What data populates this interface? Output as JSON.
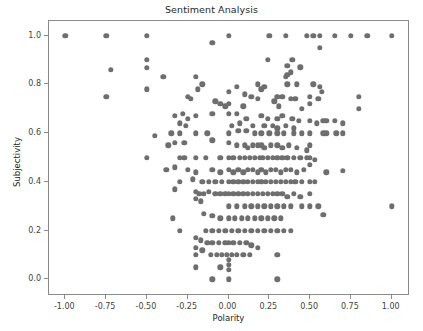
{
  "chart_data": {
    "type": "scatter",
    "title": "Sentiment Analysis",
    "xlabel": "Polarity",
    "ylabel": "Subjectivity",
    "xlim": [
      -1.1,
      1.1
    ],
    "ylim": [
      -0.06,
      1.06
    ],
    "xticks": [
      -1.0,
      -0.75,
      -0.5,
      -0.25,
      0.0,
      0.25,
      0.5,
      0.75,
      1.0
    ],
    "xticklabels": [
      "-1.00",
      "-0.75",
      "-0.50",
      "-0.25",
      "0.00",
      "0.25",
      "0.50",
      "0.75",
      "1.00"
    ],
    "yticks": [
      0.0,
      0.2,
      0.4,
      0.6,
      0.8,
      1.0
    ],
    "yticklabels": [
      "0.0",
      "0.2",
      "0.4",
      "0.6",
      "0.8",
      "1.0"
    ],
    "grid": false,
    "legend": null,
    "marker_color": "#6e6e6e",
    "marker_size": 5.4,
    "series": [
      {
        "name": "tweets",
        "points": [
          [
            -1.0,
            1.0
          ],
          [
            -0.75,
            1.0
          ],
          [
            -0.5,
            1.0
          ],
          [
            -0.1,
            0.97
          ],
          [
            0.0,
            1.0
          ],
          [
            0.25,
            1.0
          ],
          [
            0.35,
            1.0
          ],
          [
            0.48,
            1.0
          ],
          [
            0.52,
            1.0
          ],
          [
            0.56,
            1.0
          ],
          [
            0.65,
            1.0
          ],
          [
            0.75,
            1.0
          ],
          [
            0.85,
            1.0
          ],
          [
            1.0,
            1.0
          ],
          [
            0.56,
            0.95
          ],
          [
            -0.5,
            0.9
          ],
          [
            0.24,
            0.9
          ],
          [
            0.39,
            0.9
          ],
          [
            0.36,
            0.875
          ],
          [
            -0.72,
            0.86
          ],
          [
            -0.5,
            0.867
          ],
          [
            0.38,
            0.85
          ],
          [
            0.36,
            0.84
          ],
          [
            0.44,
            0.87
          ],
          [
            -0.4,
            0.83
          ],
          [
            -0.2,
            0.83
          ],
          [
            0.35,
            0.83
          ],
          [
            0.42,
            0.8
          ],
          [
            0.18,
            0.8
          ],
          [
            -0.16,
            0.8
          ],
          [
            -0.19,
            0.78
          ],
          [
            -0.5,
            0.78
          ],
          [
            0.52,
            0.8
          ],
          [
            0.56,
            0.79
          ],
          [
            0.57,
            0.77
          ],
          [
            0.36,
            0.8
          ],
          [
            0.05,
            0.79
          ],
          [
            0.22,
            0.79
          ],
          [
            0.2,
            0.78
          ],
          [
            -0.75,
            0.75
          ],
          [
            -0.25,
            0.75
          ],
          [
            -0.23,
            0.74
          ],
          [
            0.0,
            0.77
          ],
          [
            0.1,
            0.76
          ],
          [
            0.14,
            0.75
          ],
          [
            0.18,
            0.74
          ],
          [
            0.3,
            0.75
          ],
          [
            0.33,
            0.75
          ],
          [
            0.38,
            0.74
          ],
          [
            0.41,
            0.74
          ],
          [
            0.5,
            0.75
          ],
          [
            0.55,
            0.74
          ],
          [
            0.8,
            0.75
          ],
          [
            0.8,
            0.7
          ],
          [
            -0.08,
            0.73
          ],
          [
            -0.05,
            0.72
          ],
          [
            0.0,
            0.72
          ],
          [
            -0.02,
            0.71
          ],
          [
            0.45,
            0.7
          ],
          [
            0.5,
            0.72
          ],
          [
            0.09,
            0.71
          ],
          [
            0.28,
            0.73
          ],
          [
            0.31,
            0.71
          ],
          [
            -0.33,
            0.67
          ],
          [
            -0.28,
            0.68
          ],
          [
            -0.25,
            0.66
          ],
          [
            -0.2,
            0.67
          ],
          [
            -0.1,
            0.68
          ],
          [
            0.0,
            0.68
          ],
          [
            0.05,
            0.68
          ],
          [
            0.11,
            0.66
          ],
          [
            0.2,
            0.67
          ],
          [
            0.24,
            0.66
          ],
          [
            0.3,
            0.66
          ],
          [
            0.33,
            0.67
          ],
          [
            0.39,
            0.66
          ],
          [
            0.43,
            0.65
          ],
          [
            0.5,
            0.65
          ],
          [
            0.54,
            0.64
          ],
          [
            0.58,
            0.65
          ],
          [
            0.6,
            0.65
          ],
          [
            0.65,
            0.65
          ],
          [
            0.7,
            0.64
          ],
          [
            -0.3,
            0.64
          ],
          [
            -0.26,
            0.63
          ],
          [
            0.02,
            0.63
          ],
          [
            0.07,
            0.64
          ],
          [
            0.15,
            0.63
          ],
          [
            0.22,
            0.63
          ],
          [
            0.27,
            0.63
          ],
          [
            0.3,
            0.62
          ],
          [
            0.35,
            0.63
          ],
          [
            0.4,
            0.62
          ],
          [
            -0.45,
            0.59
          ],
          [
            -0.35,
            0.6
          ],
          [
            -0.3,
            0.6
          ],
          [
            -0.2,
            0.6
          ],
          [
            -0.13,
            0.6
          ],
          [
            0.0,
            0.6
          ],
          [
            0.06,
            0.61
          ],
          [
            0.11,
            0.61
          ],
          [
            0.16,
            0.6
          ],
          [
            0.2,
            0.6
          ],
          [
            0.25,
            0.6
          ],
          [
            0.3,
            0.6
          ],
          [
            0.34,
            0.6
          ],
          [
            0.4,
            0.6
          ],
          [
            0.45,
            0.6
          ],
          [
            0.5,
            0.6
          ],
          [
            0.58,
            0.6
          ],
          [
            0.6,
            0.6
          ],
          [
            0.66,
            0.6
          ],
          [
            0.7,
            0.6
          ],
          [
            -0.37,
            0.55
          ],
          [
            -0.33,
            0.56
          ],
          [
            -0.27,
            0.56
          ],
          [
            -0.1,
            0.57
          ],
          [
            0.0,
            0.56
          ],
          [
            0.05,
            0.55
          ],
          [
            0.1,
            0.55
          ],
          [
            0.12,
            0.54
          ],
          [
            0.15,
            0.55
          ],
          [
            0.18,
            0.55
          ],
          [
            0.2,
            0.55
          ],
          [
            0.22,
            0.54
          ],
          [
            0.26,
            0.55
          ],
          [
            0.3,
            0.55
          ],
          [
            0.33,
            0.54
          ],
          [
            0.37,
            0.55
          ],
          [
            0.42,
            0.54
          ],
          [
            0.48,
            0.53
          ],
          [
            0.5,
            0.55
          ],
          [
            -0.5,
            0.5
          ],
          [
            -0.3,
            0.5
          ],
          [
            -0.27,
            0.5
          ],
          [
            -0.2,
            0.5
          ],
          [
            -0.14,
            0.5
          ],
          [
            -0.05,
            0.5
          ],
          [
            0.0,
            0.5
          ],
          [
            0.03,
            0.5
          ],
          [
            0.07,
            0.5
          ],
          [
            0.1,
            0.5
          ],
          [
            0.13,
            0.5
          ],
          [
            0.16,
            0.5
          ],
          [
            0.19,
            0.5
          ],
          [
            0.21,
            0.5
          ],
          [
            0.24,
            0.5
          ],
          [
            0.27,
            0.5
          ],
          [
            0.3,
            0.5
          ],
          [
            0.33,
            0.5
          ],
          [
            0.36,
            0.5
          ],
          [
            0.4,
            0.5
          ],
          [
            0.44,
            0.5
          ],
          [
            0.48,
            0.5
          ],
          [
            0.5,
            0.5
          ],
          [
            0.53,
            0.49
          ],
          [
            -0.38,
            0.45
          ],
          [
            -0.33,
            0.46
          ],
          [
            -0.25,
            0.45
          ],
          [
            -0.2,
            0.44
          ],
          [
            -0.1,
            0.45
          ],
          [
            -0.05,
            0.44
          ],
          [
            0.0,
            0.45
          ],
          [
            0.03,
            0.44
          ],
          [
            0.06,
            0.45
          ],
          [
            0.09,
            0.44
          ],
          [
            0.12,
            0.45
          ],
          [
            0.15,
            0.45
          ],
          [
            0.18,
            0.44
          ],
          [
            0.2,
            0.45
          ],
          [
            0.23,
            0.44
          ],
          [
            0.26,
            0.45
          ],
          [
            0.29,
            0.45
          ],
          [
            0.32,
            0.44
          ],
          [
            0.35,
            0.45
          ],
          [
            0.38,
            0.45
          ],
          [
            0.42,
            0.44
          ],
          [
            0.46,
            0.45
          ],
          [
            0.5,
            0.47
          ],
          [
            0.6,
            0.44
          ],
          [
            0.7,
            0.445
          ],
          [
            -0.3,
            0.4
          ],
          [
            -0.22,
            0.41
          ],
          [
            -0.16,
            0.4
          ],
          [
            -0.12,
            0.4
          ],
          [
            -0.08,
            0.4
          ],
          [
            -0.04,
            0.4
          ],
          [
            0.0,
            0.4
          ],
          [
            0.03,
            0.4
          ],
          [
            0.06,
            0.4
          ],
          [
            0.09,
            0.4
          ],
          [
            0.12,
            0.4
          ],
          [
            0.15,
            0.4
          ],
          [
            0.18,
            0.4
          ],
          [
            0.2,
            0.4
          ],
          [
            0.23,
            0.4
          ],
          [
            0.26,
            0.4
          ],
          [
            0.29,
            0.4
          ],
          [
            0.32,
            0.4
          ],
          [
            0.35,
            0.4
          ],
          [
            0.38,
            0.4
          ],
          [
            0.41,
            0.4
          ],
          [
            0.45,
            0.4
          ],
          [
            0.5,
            0.4
          ],
          [
            0.53,
            0.4
          ],
          [
            -0.33,
            0.37
          ],
          [
            -0.2,
            0.36
          ],
          [
            -0.18,
            0.35
          ],
          [
            -0.15,
            0.35
          ],
          [
            -0.12,
            0.36
          ],
          [
            -0.08,
            0.35
          ],
          [
            -0.05,
            0.35
          ],
          [
            -0.02,
            0.35
          ],
          [
            0.0,
            0.35
          ],
          [
            0.03,
            0.35
          ],
          [
            0.06,
            0.35
          ],
          [
            0.09,
            0.35
          ],
          [
            0.12,
            0.35
          ],
          [
            0.15,
            0.35
          ],
          [
            0.18,
            0.35
          ],
          [
            0.21,
            0.35
          ],
          [
            0.24,
            0.35
          ],
          [
            0.27,
            0.35
          ],
          [
            0.3,
            0.35
          ],
          [
            0.33,
            0.35
          ],
          [
            0.36,
            0.34
          ],
          [
            0.4,
            0.35
          ],
          [
            0.44,
            0.34
          ],
          [
            0.5,
            0.35
          ],
          [
            0.55,
            0.3
          ],
          [
            -0.2,
            0.33
          ],
          [
            -0.17,
            0.32
          ],
          [
            0.0,
            0.3
          ],
          [
            0.05,
            0.3
          ],
          [
            0.1,
            0.3
          ],
          [
            0.14,
            0.3
          ],
          [
            0.18,
            0.3
          ],
          [
            0.22,
            0.3
          ],
          [
            0.26,
            0.3
          ],
          [
            0.3,
            0.3
          ],
          [
            0.34,
            0.3
          ],
          [
            0.38,
            0.3
          ],
          [
            0.45,
            0.3
          ],
          [
            0.5,
            0.3
          ],
          [
            1.0,
            0.3
          ],
          [
            -0.34,
            0.25
          ],
          [
            -0.15,
            0.27
          ],
          [
            -0.1,
            0.26
          ],
          [
            -0.05,
            0.25
          ],
          [
            0.0,
            0.25
          ],
          [
            0.04,
            0.25
          ],
          [
            0.08,
            0.25
          ],
          [
            0.12,
            0.25
          ],
          [
            0.16,
            0.25
          ],
          [
            0.2,
            0.25
          ],
          [
            0.24,
            0.25
          ],
          [
            0.28,
            0.25
          ],
          [
            0.32,
            0.25
          ],
          [
            0.58,
            0.265
          ],
          [
            -0.3,
            0.2
          ],
          [
            -0.14,
            0.2
          ],
          [
            -0.1,
            0.2
          ],
          [
            -0.06,
            0.2
          ],
          [
            -0.02,
            0.2
          ],
          [
            0.02,
            0.2
          ],
          [
            0.06,
            0.2
          ],
          [
            0.1,
            0.2
          ],
          [
            0.14,
            0.2
          ],
          [
            0.18,
            0.2
          ],
          [
            0.22,
            0.2
          ],
          [
            0.26,
            0.2
          ],
          [
            0.3,
            0.2
          ],
          [
            0.34,
            0.2
          ],
          [
            0.38,
            0.2
          ],
          [
            -0.2,
            0.17
          ],
          [
            -0.17,
            0.16
          ],
          [
            -0.13,
            0.15
          ],
          [
            -0.1,
            0.15
          ],
          [
            -0.06,
            0.15
          ],
          [
            -0.02,
            0.15
          ],
          [
            0.0,
            0.15
          ],
          [
            0.03,
            0.15
          ],
          [
            0.07,
            0.15
          ],
          [
            0.11,
            0.15
          ],
          [
            0.14,
            0.14
          ],
          [
            0.18,
            0.13
          ],
          [
            -0.2,
            0.13
          ],
          [
            -0.16,
            0.12
          ],
          [
            -0.2,
            0.1
          ],
          [
            -0.11,
            0.1
          ],
          [
            -0.07,
            0.1
          ],
          [
            -0.04,
            0.1
          ],
          [
            -0.01,
            0.1
          ],
          [
            0.02,
            0.1
          ],
          [
            0.05,
            0.1
          ],
          [
            0.09,
            0.1
          ],
          [
            0.13,
            0.1
          ],
          [
            0.3,
            0.1
          ],
          [
            0.0,
            0.08
          ],
          [
            0.0,
            0.06
          ],
          [
            0.0,
            0.04
          ],
          [
            -0.05,
            0.05
          ],
          [
            -0.2,
            0.05
          ],
          [
            -0.1,
            0.0
          ],
          [
            0.0,
            0.0
          ],
          [
            0.3,
            0.0
          ]
        ]
      }
    ]
  },
  "axes": {
    "title": "Sentiment Analysis",
    "xlabel": "Polarity",
    "ylabel": "Subjectivity"
  }
}
